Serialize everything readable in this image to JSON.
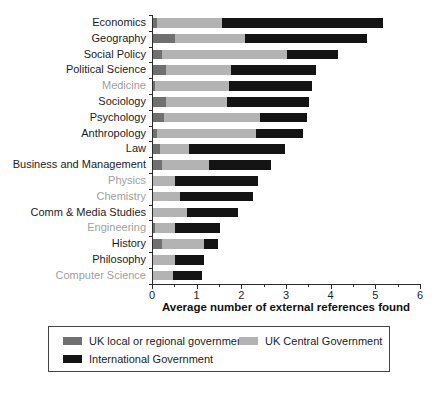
{
  "chart_data": {
    "type": "bar",
    "orientation": "horizontal",
    "stacked": true,
    "title": "",
    "xlabel": "Average number of external references found",
    "ylabel": "",
    "xlim": [
      0,
      6
    ],
    "x_ticks": [
      0,
      1,
      2,
      3,
      4,
      5,
      6
    ],
    "grid": false,
    "legend_position": "bottom-boxed",
    "categories": [
      "Economics",
      "Geography",
      "Social Policy",
      "Political Science",
      "Medicine",
      "Sociology",
      "Psychology",
      "Anthropology",
      "Law",
      "Business and Management",
      "Physics",
      "Chemistry",
      "Comm & Media Studies",
      "Engineering",
      "History",
      "Philosophy",
      "Computer Science"
    ],
    "category_label_muted": [
      false,
      false,
      false,
      false,
      true,
      false,
      false,
      false,
      false,
      false,
      true,
      true,
      false,
      true,
      false,
      false,
      true
    ],
    "series": [
      {
        "name": "UK local or regional government",
        "color": "#707070",
        "values": [
          0.1,
          0.5,
          0.2,
          0.3,
          0.05,
          0.3,
          0.25,
          0.1,
          0.15,
          0.2,
          0.0,
          0.0,
          0.0,
          0.05,
          0.2,
          0.0,
          0.0
        ]
      },
      {
        "name": "UK Central Government",
        "color": "#b3b3b3",
        "values": [
          1.45,
          1.55,
          2.8,
          1.45,
          1.65,
          1.35,
          2.15,
          2.2,
          0.65,
          1.05,
          0.5,
          0.6,
          0.75,
          0.45,
          0.95,
          0.5,
          0.45
        ]
      },
      {
        "name": "International Government",
        "color": "#141414",
        "values": [
          3.6,
          2.75,
          1.15,
          1.9,
          1.85,
          1.85,
          1.05,
          1.05,
          2.15,
          1.4,
          1.85,
          1.65,
          1.15,
          1.0,
          0.3,
          0.65,
          0.65
        ]
      }
    ]
  },
  "colors": {
    "axis": "#2a2a2a",
    "label_default": "#1c1c1c",
    "label_muted": "#9f9f9f",
    "background": "#ffffff"
  }
}
